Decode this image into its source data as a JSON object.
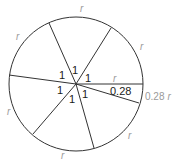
{
  "diagram": {
    "colors": {
      "line": "#333333",
      "label_dark": "#1a1a1a",
      "label_light": "#9a9a9a"
    },
    "circle": {
      "cx": 76,
      "cy": 84,
      "r": 67
    },
    "radii_endpoints": [
      {
        "x": 143,
        "y": 84
      },
      {
        "x": 111,
        "y": 28
      },
      {
        "x": 49,
        "y": 23
      },
      {
        "x": 9,
        "y": 75
      },
      {
        "x": 33,
        "y": 134
      },
      {
        "x": 94,
        "y": 148
      },
      {
        "x": 139,
        "y": 103
      }
    ],
    "arc_labels": [
      {
        "text": "r",
        "x": 80,
        "y": 12
      },
      {
        "text": "r",
        "x": 16,
        "y": 40
      },
      {
        "text": "r",
        "x": 140,
        "y": 50
      },
      {
        "text": "r",
        "x": 7,
        "y": 115
      },
      {
        "text": "r",
        "x": 128,
        "y": 139
      },
      {
        "text": "r",
        "x": 61,
        "y": 159
      },
      {
        "text": "r",
        "x": 113,
        "y": 82
      }
    ],
    "angle_labels": [
      {
        "text": "1",
        "x": 59,
        "y": 79
      },
      {
        "text": "1",
        "x": 72,
        "y": 74
      },
      {
        "text": "1",
        "x": 85,
        "y": 82
      },
      {
        "text": "1",
        "x": 57,
        "y": 94
      },
      {
        "text": "1",
        "x": 69,
        "y": 103
      },
      {
        "text": "1",
        "x": 82,
        "y": 98
      }
    ],
    "small_angle_label": {
      "text": "0.28",
      "x": 110,
      "y": 95
    },
    "small_arc_label": {
      "value": "0.28",
      "unit": "r",
      "x": 145,
      "y": 100
    }
  }
}
